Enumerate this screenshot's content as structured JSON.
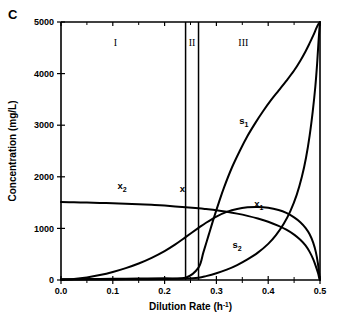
{
  "panel": {
    "label": "C"
  },
  "chart_data": {
    "type": "line",
    "title": "",
    "panel_label": "C",
    "xlabel": "Dilution Rate (h-1)",
    "xlabel_base": "Dilution Rate (h",
    "xlabel_exp": "-1",
    "xlabel_close": ")",
    "ylabel": "Concentration (mg/L)",
    "xlim": [
      0.0,
      0.5
    ],
    "ylim": [
      0,
      5000
    ],
    "xticks": [
      0.0,
      0.1,
      0.2,
      0.3,
      0.4,
      0.5
    ],
    "xticklabels": [
      "0.0",
      "0.1",
      "0.2",
      "0.3",
      "0.4",
      "0.5"
    ],
    "xminorticks": [
      0.05,
      0.15,
      0.25,
      0.35,
      0.45
    ],
    "yticks": [
      0,
      1000,
      2000,
      3000,
      4000,
      5000
    ],
    "yticklabels": [
      "0",
      "1000",
      "2000",
      "3000",
      "4000",
      "5000"
    ],
    "grid": false,
    "legend": "inline-labels",
    "regions": [
      {
        "name": "I",
        "label": "I",
        "x_start": 0.0,
        "x_end": 0.2405,
        "label_x": 0.105,
        "label_y": 4530
      },
      {
        "name": "II",
        "label": "II",
        "x_start": 0.2405,
        "x_end": 0.2655,
        "label_x": 0.253,
        "label_y": 4530
      },
      {
        "name": "III",
        "label": "III",
        "x_start": 0.2655,
        "x_end": 0.5,
        "label_x": 0.352,
        "label_y": 4530
      }
    ],
    "region_boundaries": [
      0.2405,
      0.2655
    ],
    "annotations": [
      {
        "text": "x",
        "x": 0.2405,
        "y": 1640,
        "label_x": 0.2345,
        "label_y": 1700
      },
      {
        "text": "x1",
        "base": "x",
        "sub": "1",
        "label_x": 0.382,
        "label_y": 1420
      },
      {
        "text": "x2",
        "base": "x",
        "sub": "2",
        "label_x": 0.118,
        "label_y": 1760
      },
      {
        "text": "s1",
        "base": "s",
        "sub": "1",
        "label_x": 0.353,
        "label_y": 3020
      },
      {
        "text": "s2",
        "base": "s",
        "sub": "2",
        "label_x": 0.34,
        "label_y": 620
      }
    ],
    "series": [
      {
        "name": "x2",
        "label": "x2",
        "comment": "biomass 2 - flat near 1500 then declines to zero at D=0.5",
        "points": [
          [
            0.0,
            1510
          ],
          [
            0.025,
            1505
          ],
          [
            0.05,
            1500
          ],
          [
            0.075,
            1494
          ],
          [
            0.1,
            1487
          ],
          [
            0.125,
            1478
          ],
          [
            0.15,
            1468
          ],
          [
            0.175,
            1456
          ],
          [
            0.2,
            1442
          ],
          [
            0.2405,
            1410
          ],
          [
            0.2655,
            1390
          ],
          [
            0.28,
            1375
          ],
          [
            0.3,
            1352
          ],
          [
            0.32,
            1322
          ],
          [
            0.34,
            1286
          ],
          [
            0.36,
            1243
          ],
          [
            0.38,
            1192
          ],
          [
            0.4,
            1130
          ],
          [
            0.42,
            1050
          ],
          [
            0.435,
            975
          ],
          [
            0.45,
            880
          ],
          [
            0.462,
            780
          ],
          [
            0.472,
            670
          ],
          [
            0.48,
            545
          ],
          [
            0.487,
            400
          ],
          [
            0.492,
            265
          ],
          [
            0.496,
            140
          ],
          [
            0.4985,
            40
          ],
          [
            0.5,
            0
          ]
        ]
      },
      {
        "name": "x1",
        "label": "x1",
        "comment": "biomass 1 - rises from 0 in region I, peaks then declines to 0 at D=0.5",
        "points": [
          [
            0.0,
            5
          ],
          [
            0.025,
            20
          ],
          [
            0.05,
            50
          ],
          [
            0.075,
            95
          ],
          [
            0.1,
            155
          ],
          [
            0.125,
            230
          ],
          [
            0.15,
            320
          ],
          [
            0.175,
            430
          ],
          [
            0.2,
            560
          ],
          [
            0.22,
            685
          ],
          [
            0.2405,
            830
          ],
          [
            0.2655,
            1010
          ],
          [
            0.28,
            1110
          ],
          [
            0.3,
            1230
          ],
          [
            0.32,
            1320
          ],
          [
            0.34,
            1378
          ],
          [
            0.36,
            1408
          ],
          [
            0.38,
            1415
          ],
          [
            0.4,
            1398
          ],
          [
            0.42,
            1355
          ],
          [
            0.435,
            1300
          ],
          [
            0.45,
            1215
          ],
          [
            0.462,
            1120
          ],
          [
            0.472,
            1010
          ],
          [
            0.48,
            885
          ],
          [
            0.487,
            720
          ],
          [
            0.492,
            540
          ],
          [
            0.496,
            320
          ],
          [
            0.4985,
            110
          ],
          [
            0.5,
            0
          ]
        ]
      },
      {
        "name": "s1",
        "label": "s1",
        "comment": "substrate 1 - near zero through region I and II, rises steeply in region III to 5000 at D=0.5",
        "points": [
          [
            0.0,
            15
          ],
          [
            0.05,
            18
          ],
          [
            0.1,
            22
          ],
          [
            0.15,
            28
          ],
          [
            0.2,
            35
          ],
          [
            0.2405,
            45
          ],
          [
            0.2655,
            240
          ],
          [
            0.275,
            540
          ],
          [
            0.285,
            870
          ],
          [
            0.295,
            1200
          ],
          [
            0.305,
            1510
          ],
          [
            0.315,
            1800
          ],
          [
            0.33,
            2180
          ],
          [
            0.345,
            2500
          ],
          [
            0.36,
            2790
          ],
          [
            0.375,
            3040
          ],
          [
            0.39,
            3270
          ],
          [
            0.405,
            3480
          ],
          [
            0.42,
            3670
          ],
          [
            0.435,
            3860
          ],
          [
            0.45,
            4060
          ],
          [
            0.462,
            4250
          ],
          [
            0.472,
            4430
          ],
          [
            0.48,
            4590
          ],
          [
            0.487,
            4740
          ],
          [
            0.493,
            4880
          ],
          [
            0.497,
            4960
          ],
          [
            0.5,
            5000
          ]
        ]
      },
      {
        "name": "s2",
        "label": "s2",
        "comment": "substrate 2 - near zero until region III, rises slowly then very steeply to 5000 at D=0.5",
        "points": [
          [
            0.0,
            8
          ],
          [
            0.05,
            10
          ],
          [
            0.1,
            12
          ],
          [
            0.15,
            15
          ],
          [
            0.2,
            20
          ],
          [
            0.2405,
            28
          ],
          [
            0.2655,
            45
          ],
          [
            0.28,
            75
          ],
          [
            0.3,
            130
          ],
          [
            0.32,
            200
          ],
          [
            0.34,
            290
          ],
          [
            0.36,
            400
          ],
          [
            0.38,
            530
          ],
          [
            0.4,
            700
          ],
          [
            0.415,
            870
          ],
          [
            0.43,
            1090
          ],
          [
            0.443,
            1340
          ],
          [
            0.455,
            1650
          ],
          [
            0.465,
            2000
          ],
          [
            0.473,
            2370
          ],
          [
            0.48,
            2800
          ],
          [
            0.486,
            3270
          ],
          [
            0.491,
            3750
          ],
          [
            0.4945,
            4200
          ],
          [
            0.497,
            4600
          ],
          [
            0.4988,
            4860
          ],
          [
            0.5,
            5000
          ]
        ]
      }
    ]
  }
}
